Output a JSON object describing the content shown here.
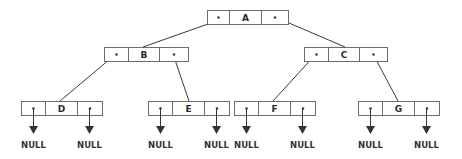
{
  "diagram": {
    "type": "binary-tree-linked-representation",
    "pointer_symbol": "*",
    "null_label": "NULL",
    "colors": {
      "box_stroke": "#6b6b6b",
      "edge": "#3a3a3a",
      "text": "#2a2a2a",
      "background": "#ffffff"
    },
    "nodes": [
      {
        "id": "A",
        "label": "A",
        "left": "*",
        "right": "*",
        "x": 207,
        "y": 10,
        "w": 81,
        "h": 14,
        "c1": 229,
        "c2": 261
      },
      {
        "id": "B",
        "label": "B",
        "left": "*",
        "right": "*",
        "x": 104,
        "y": 47,
        "w": 84,
        "h": 14,
        "c1": 128,
        "c2": 159
      },
      {
        "id": "C",
        "label": "C",
        "left": "*",
        "right": "*",
        "x": 304,
        "y": 47,
        "w": 83,
        "h": 14,
        "c1": 328,
        "c2": 359
      },
      {
        "id": "D",
        "label": "D",
        "left": "*",
        "right": "*",
        "x": 21,
        "y": 101,
        "w": 81,
        "h": 14,
        "c1": 45,
        "c2": 77
      },
      {
        "id": "E",
        "label": "E",
        "left": "*",
        "right": "*",
        "x": 148,
        "y": 101,
        "w": 81,
        "h": 14,
        "c1": 172,
        "c2": 204
      },
      {
        "id": "F",
        "label": "F",
        "left": "*",
        "right": "*",
        "x": 234,
        "y": 101,
        "w": 81,
        "h": 14,
        "c1": 258,
        "c2": 290
      },
      {
        "id": "G",
        "label": "G",
        "left": "*",
        "right": "*",
        "x": 358,
        "y": 101,
        "w": 81,
        "h": 14,
        "c1": 382,
        "c2": 414
      }
    ],
    "edges": [
      {
        "from": "A",
        "side": "left",
        "to": "B",
        "x1": 208,
        "y1": 24,
        "x2": 143,
        "y2": 47
      },
      {
        "from": "A",
        "side": "right",
        "to": "C",
        "x1": 275,
        "y1": 17,
        "x2": 345,
        "y2": 47
      },
      {
        "from": "B",
        "side": "left",
        "to": "D",
        "x1": 116,
        "y1": 54,
        "x2": 60,
        "y2": 101
      },
      {
        "from": "B",
        "side": "right",
        "to": "E",
        "x1": 173,
        "y1": 54,
        "x2": 189,
        "y2": 101
      },
      {
        "from": "C",
        "side": "left",
        "to": "F",
        "x1": 316,
        "y1": 54,
        "x2": 273,
        "y2": 101
      },
      {
        "from": "C",
        "side": "right",
        "to": "G",
        "x1": 373,
        "y1": 54,
        "x2": 398,
        "y2": 101
      }
    ],
    "null_pointers": [
      {
        "node": "D",
        "side": "left",
        "x": 33,
        "label": "NULL"
      },
      {
        "node": "D",
        "side": "right",
        "x": 89,
        "label": "NULL"
      },
      {
        "node": "E",
        "side": "left",
        "x": 160,
        "label": "NULL"
      },
      {
        "node": "E",
        "side": "right",
        "x": 216,
        "label": "NULL"
      },
      {
        "node": "F",
        "side": "left",
        "x": 246,
        "label": "NULL"
      },
      {
        "node": "F",
        "side": "right",
        "x": 302,
        "label": "NULL"
      },
      {
        "node": "G",
        "side": "left",
        "x": 370,
        "label": "NULL"
      },
      {
        "node": "G",
        "side": "right",
        "x": 426,
        "label": "NULL"
      }
    ]
  }
}
